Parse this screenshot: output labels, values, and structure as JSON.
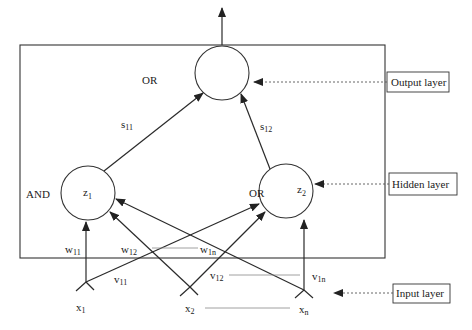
{
  "diagram": {
    "output_node": {
      "name": "y",
      "gate": "OR"
    },
    "hidden_nodes": [
      {
        "name": "z",
        "sub": "1",
        "gate": "AND"
      },
      {
        "name": "z",
        "sub": "2",
        "gate": "OR"
      }
    ],
    "input_nodes": [
      {
        "name": "x",
        "sub": "1"
      },
      {
        "name": "x",
        "sub": "2"
      },
      {
        "name": "x",
        "sub": "n"
      }
    ],
    "weights_output": [
      {
        "name": "s",
        "sub": "11"
      },
      {
        "name": "s",
        "sub": "12"
      }
    ],
    "weights_w": [
      {
        "name": "w",
        "sub": "11"
      },
      {
        "name": "w",
        "sub": "12"
      },
      {
        "name": "w",
        "sub": "1n"
      }
    ],
    "weights_v": [
      {
        "name": "v",
        "sub": "11"
      },
      {
        "name": "v",
        "sub": "12"
      },
      {
        "name": "v",
        "sub": "1n"
      }
    ],
    "layer_labels": {
      "output": "Output layer",
      "hidden": "Hidden layer",
      "input": "Input layer"
    }
  }
}
